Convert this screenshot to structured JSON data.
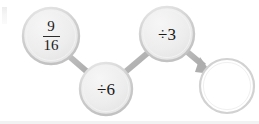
{
  "diagram": {
    "type": "flow-chain",
    "title": "",
    "background_color": "#ffffff",
    "node_fill_color": "#ececec",
    "node_stroke_color": "#c6c6c6",
    "connector_color": "#b0b0b0",
    "text_color": "#1a1a1a",
    "nodes": [
      {
        "id": "start-value",
        "kind": "fraction",
        "numerator": "9",
        "denominator": "16",
        "label": "9/16",
        "cx": 51,
        "cy": 36,
        "r": 28,
        "filled": true
      },
      {
        "id": "operation-1",
        "kind": "operation",
        "label": "÷6",
        "cx": 106,
        "cy": 89,
        "r": 26,
        "filled": true
      },
      {
        "id": "operation-2",
        "kind": "operation",
        "label": "÷3",
        "cx": 167,
        "cy": 34,
        "r": 27,
        "filled": true
      },
      {
        "id": "answer-blank",
        "kind": "answer",
        "label": "",
        "cx": 227,
        "cy": 86,
        "r": 27,
        "filled": false
      }
    ],
    "connectors": [
      {
        "id": "link-start-to-op1",
        "from": "start-value",
        "to": "operation-1",
        "arrow": false
      },
      {
        "id": "link-op1-to-op2",
        "from": "operation-1",
        "to": "operation-2",
        "arrow": false
      },
      {
        "id": "link-op2-to-answer",
        "from": "operation-2",
        "to": "answer-blank",
        "arrow": true
      }
    ]
  }
}
